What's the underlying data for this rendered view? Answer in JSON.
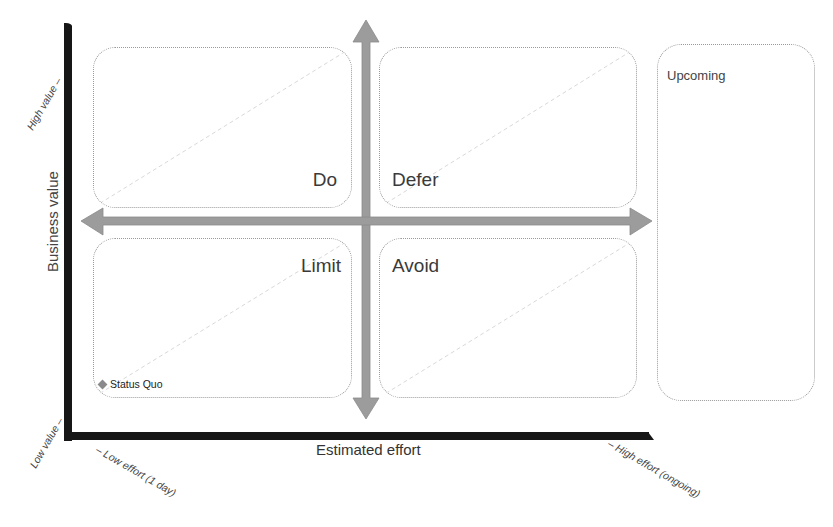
{
  "diagram": {
    "type": "value-effort-matrix",
    "y_axis": {
      "title": "Business value",
      "high_label": "High value –",
      "low_label": "Low value –"
    },
    "x_axis": {
      "title": "Estimated effort",
      "low_label": "– Low effort (1 day)",
      "high_label": "– High effort (ongoing)"
    },
    "quadrants": [
      {
        "id": "do",
        "label": "Do",
        "position": "high value, low effort"
      },
      {
        "id": "defer",
        "label": "Defer",
        "position": "high value, high effort"
      },
      {
        "id": "limit",
        "label": "Limit",
        "position": "low value, low effort"
      },
      {
        "id": "avoid",
        "label": "Avoid",
        "position": "low value, high effort"
      }
    ],
    "side_panel": {
      "label": "Upcoming"
    },
    "items": [
      {
        "label": "Status Quo",
        "marker": "diamond"
      }
    ],
    "colors": {
      "axis": "#161616",
      "arrow": "#999999",
      "box_border": "#9a9a9a",
      "text": "#3a3a3a"
    }
  }
}
